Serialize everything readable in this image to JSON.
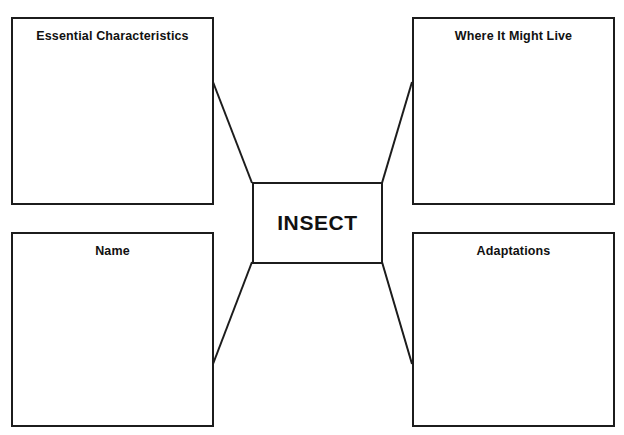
{
  "page": {
    "heading": "Brainstorm",
    "background_color": "#ffffff",
    "line_color": "#1c1c1c",
    "text_color": "#111111"
  },
  "organizer": {
    "center": {
      "id": "center",
      "label": "INSECT"
    },
    "nodes": [
      {
        "id": "essential-characteristics",
        "label": "Essential Characteristics",
        "position": "top-left"
      },
      {
        "id": "where-it-might-live",
        "label": "Where It Might Live",
        "position": "top-right"
      },
      {
        "id": "name",
        "label": "Name",
        "position": "bottom-left"
      },
      {
        "id": "adaptations",
        "label": "Adaptations",
        "position": "bottom-right"
      }
    ],
    "connectors": [
      {
        "id": "connector-top-left",
        "from": "center-top-left",
        "to": "essential-characteristics"
      },
      {
        "id": "connector-top-right",
        "from": "center-top-right",
        "to": "where-it-might-live"
      },
      {
        "id": "connector-bottom-left",
        "from": "center-bottom-left",
        "to": "name"
      },
      {
        "id": "connector-bottom-right",
        "from": "center-bottom-right",
        "to": "adaptations"
      }
    ]
  }
}
